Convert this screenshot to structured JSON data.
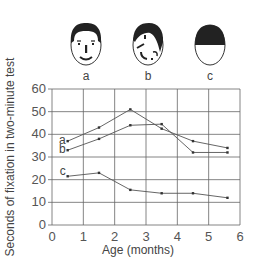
{
  "faces": [
    {
      "id": "a",
      "label": "a",
      "description": "normal face"
    },
    {
      "id": "b",
      "label": "b",
      "description": "scrambled face"
    },
    {
      "id": "c",
      "label": "c",
      "description": "blank face with dark hair"
    }
  ],
  "chart_data": {
    "type": "line",
    "title": "",
    "xlabel": "Age (months)",
    "ylabel": "Seconds of fixation in two-minute test",
    "xlim": [
      0,
      6
    ],
    "ylim": [
      0,
      60
    ],
    "x_ticks": [
      "0",
      "1",
      "2",
      "3",
      "4",
      "5",
      "6"
    ],
    "y_ticks": [
      "0",
      "10",
      "20",
      "30",
      "40",
      "50",
      "60"
    ],
    "grid": true,
    "legend": "inline labels at start of each line",
    "x": [
      0.5,
      1.5,
      2.5,
      3.5,
      4.5,
      5.6
    ],
    "series": [
      {
        "name": "a",
        "values": [
          37,
          43,
          51,
          42.5,
          37,
          34
        ]
      },
      {
        "name": "b",
        "values": [
          33,
          38,
          44,
          44.5,
          32,
          32
        ]
      },
      {
        "name": "c",
        "values": [
          21.5,
          23,
          15.5,
          14,
          14,
          12
        ]
      }
    ]
  }
}
